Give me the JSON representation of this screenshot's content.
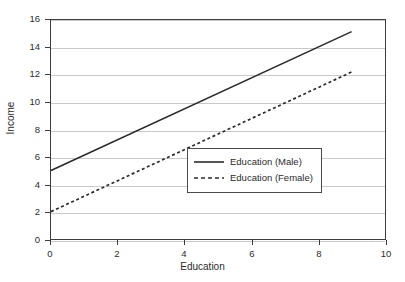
{
  "chart_data": {
    "type": "line",
    "title": "",
    "xlabel": "Education",
    "ylabel": "Income",
    "xlim": [
      0,
      10
    ],
    "ylim": [
      0,
      16
    ],
    "xticks": [
      "0",
      "2",
      "4",
      "6",
      "8",
      "10"
    ],
    "yticks": [
      "0",
      "2",
      "4",
      "6",
      "8",
      "10",
      "12",
      "14",
      "16"
    ],
    "xtick_values": [
      0,
      2,
      4,
      6,
      8,
      10
    ],
    "ytick_values": [
      0,
      2,
      4,
      6,
      8,
      10,
      12,
      14,
      16
    ],
    "grid": "horizontal",
    "legend_position": "center-right",
    "series": [
      {
        "name": "Education (Male)",
        "style": "solid",
        "color": "#2b2b2b",
        "x": [
          0,
          9
        ],
        "values": [
          5.0,
          15.15
        ]
      },
      {
        "name": "Education (Female)",
        "style": "dashed",
        "color": "#2b2b2b",
        "x": [
          0,
          9
        ],
        "values": [
          2.0,
          12.2
        ]
      }
    ]
  },
  "legend": {
    "entries": [
      {
        "label": "Education (Male)"
      },
      {
        "label": "Education (Female)"
      }
    ]
  },
  "colors": {
    "axis": "#3d3d3d",
    "grid": "#c9c9c9",
    "text": "#2b2b2b",
    "background": "#ffffff"
  }
}
